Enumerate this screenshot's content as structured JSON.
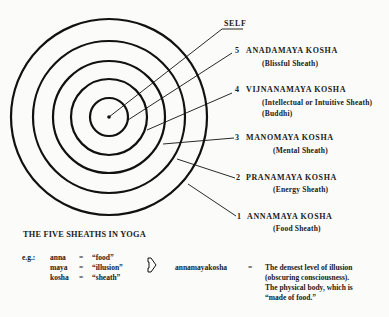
{
  "diagram": {
    "title": "THE FIVE SHEATHS IN YOGA",
    "center": {
      "x": 109,
      "y": 117
    },
    "rings": [
      {
        "radius": 98,
        "number": "1",
        "name": "ANNAMAYA KOSHA",
        "meaning": "(Food Sheath)"
      },
      {
        "radius": 76,
        "number": "2",
        "name": "PRANAMAYA KOSHA",
        "meaning": "(Energy Sheath)"
      },
      {
        "radius": 56,
        "number": "3",
        "name": "MANOMAYA KOSHA",
        "meaning": "(Mental Sheath)"
      },
      {
        "radius": 38,
        "number": "4",
        "name": "VIJNANAMAYA KOSHA",
        "meaning": "(Intellectual or Intuitive Sheath)",
        "meaning2": "(Buddhi)"
      },
      {
        "radius": 19,
        "number": "5",
        "name": "ANADAMAYA KOSHA",
        "meaning": "(Blissful Sheath)"
      }
    ],
    "self_label": "SELF",
    "stroke_color": "#111111"
  },
  "example": {
    "prefix": "e.g.:",
    "rows": [
      {
        "term": "anna",
        "eq": "=",
        "gloss": "“food”"
      },
      {
        "term": "maya",
        "eq": "=",
        "gloss": "“illusion”"
      },
      {
        "term": "kosha",
        "eq": "=",
        "gloss": "“sheath”"
      }
    ],
    "arrow_icon": "right-arrow-outline",
    "compound": "annamayakosha",
    "compound_eq": "=",
    "definition": [
      "The densest level of illusion",
      "(obscuring consciousness).",
      "The physical body, which is",
      "“made of food.”"
    ]
  }
}
